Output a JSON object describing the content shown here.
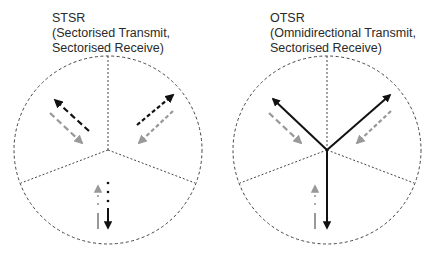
{
  "colors": {
    "background": "#ffffff",
    "boundary": "#444444",
    "transmit": "#111111",
    "receive": "#999999",
    "text": "#2a2a2a"
  },
  "panels": [
    {
      "id": "stsr",
      "title": "STSR",
      "subtitle_line1": "(Sectorised Transmit,",
      "subtitle_line2": "Sectorised Receive)",
      "transmit_style": "sectorised",
      "receive_style": "sectorised",
      "sectors": 3
    },
    {
      "id": "otsr",
      "title": "OTSR",
      "subtitle_line1": "(Omnidirectional Transmit,",
      "subtitle_line2": "Sectorised Receive)",
      "transmit_style": "omnidirectional",
      "receive_style": "sectorised",
      "sectors": 3
    }
  ],
  "legend_semantics": {
    "black_arrows": "transmit",
    "grey_arrows": "receive",
    "dashed_circle": "cell boundary",
    "dashed_radial_lines": "sector boundaries"
  }
}
